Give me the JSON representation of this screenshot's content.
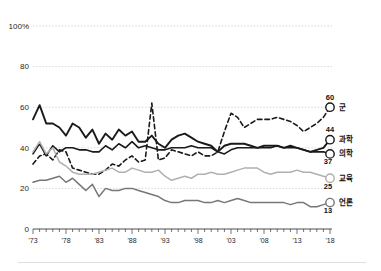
{
  "chart_data": {
    "type": "line",
    "title": "",
    "subtitle": "",
    "xlabel": "",
    "ylabel": "",
    "xlim": [
      1973,
      2018
    ],
    "ylim": [
      0,
      100
    ],
    "grid": true,
    "legend_position": "right-end-labels",
    "y_ticks": [
      "100%",
      "80",
      "60",
      "40",
      "20",
      "0"
    ],
    "y_tick_values": [
      100,
      80,
      60,
      40,
      20,
      0
    ],
    "x_ticks": [
      "'73",
      "'78",
      "'83",
      "'88",
      "'93",
      "'98",
      "'03",
      "'08",
      "'13",
      "'18"
    ],
    "x_tick_values": [
      1973,
      1978,
      1983,
      1988,
      1993,
      1998,
      2003,
      2008,
      2013,
      2018
    ],
    "x": [
      1973,
      1974,
      1975,
      1976,
      1977,
      1978,
      1979,
      1980,
      1981,
      1982,
      1983,
      1984,
      1985,
      1986,
      1987,
      1988,
      1989,
      1990,
      1991,
      1992,
      1993,
      1994,
      1995,
      1996,
      1997,
      1998,
      1999,
      2000,
      2001,
      2002,
      2003,
      2004,
      2005,
      2006,
      2007,
      2008,
      2009,
      2010,
      2011,
      2012,
      2013,
      2014,
      2015,
      2016,
      2017,
      2018
    ],
    "series": [
      {
        "name": "군",
        "end_value": 60,
        "end_label": "60",
        "color": "#1a1a1a",
        "style": "dashed",
        "width": 1.6,
        "values": [
          32,
          36,
          37,
          34,
          39,
          38,
          30,
          29,
          28,
          27,
          27,
          29,
          32,
          31,
          34,
          36,
          33,
          34,
          62,
          34,
          35,
          39,
          38,
          37,
          36,
          38,
          36,
          36,
          38,
          48,
          57,
          55,
          50,
          52,
          54,
          54,
          54,
          55,
          54,
          53,
          51,
          48,
          50,
          52,
          55,
          60
        ]
      },
      {
        "name": "과학",
        "end_value": 44,
        "end_label": "44",
        "color": "#1a1a1a",
        "style": "solid",
        "width": 1.9,
        "values": [
          54,
          61,
          52,
          52,
          50,
          46,
          52,
          50,
          45,
          49,
          42,
          47,
          44,
          49,
          46,
          48,
          43,
          43,
          46,
          42,
          40,
          44,
          46,
          47,
          45,
          43,
          42,
          41,
          38,
          41,
          42,
          42,
          42,
          41,
          40,
          41,
          41,
          41,
          40,
          41,
          40,
          39,
          38,
          39,
          40,
          44
        ]
      },
      {
        "name": "의학",
        "end_value": 37,
        "end_label": "37",
        "color": "#1a1a1a",
        "style": "solid",
        "width": 1.6,
        "values": [
          37,
          42,
          36,
          41,
          38,
          40,
          40,
          39,
          39,
          38,
          38,
          41,
          39,
          42,
          40,
          43,
          40,
          41,
          40,
          39,
          39,
          40,
          40,
          40,
          41,
          40,
          40,
          40,
          38,
          37,
          39,
          40,
          40,
          40,
          40,
          40,
          40,
          41,
          40,
          40,
          40,
          39,
          38,
          38,
          38,
          37
        ]
      },
      {
        "name": "교육",
        "end_value": 25,
        "end_label": "25",
        "color": "#b0b0b0",
        "style": "solid",
        "width": 1.5,
        "values": [
          38,
          43,
          37,
          40,
          33,
          31,
          28,
          27,
          27,
          27,
          28,
          29,
          30,
          28,
          28,
          30,
          29,
          28,
          28,
          29,
          26,
          24,
          25,
          26,
          25,
          27,
          27,
          28,
          27,
          27,
          28,
          29,
          30,
          30,
          30,
          28,
          27,
          28,
          28,
          28,
          29,
          28,
          28,
          27,
          26,
          25
        ]
      },
      {
        "name": "언론",
        "end_value": 13,
        "end_label": "13",
        "color": "#777777",
        "style": "solid",
        "width": 1.5,
        "values": [
          23,
          24,
          24,
          25,
          26,
          23,
          25,
          22,
          19,
          22,
          16,
          20,
          19,
          19,
          20,
          20,
          19,
          18,
          17,
          16,
          14,
          13,
          13,
          14,
          14,
          14,
          13,
          13,
          14,
          13,
          14,
          15,
          14,
          13,
          13,
          13,
          13,
          13,
          13,
          12,
          13,
          13,
          11,
          11,
          12,
          13
        ]
      }
    ]
  },
  "axis": {
    "y_title": "",
    "x_title": ""
  }
}
